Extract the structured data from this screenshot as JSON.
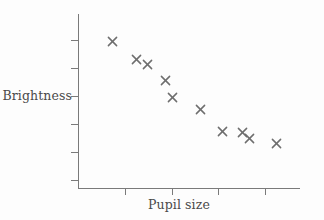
{
  "chart_data": {
    "type": "scatter",
    "title": "",
    "xlabel": "Pupil size",
    "ylabel": "Brightness",
    "grid": false,
    "legend": null,
    "axis_ticks_labeled": false,
    "marker": "x",
    "marker_color": "#6e6e6e",
    "axis_color": "#7a7a7a",
    "background_color": "#fdfdfd",
    "xlim": [
      0,
      10
    ],
    "ylim": [
      0,
      10
    ],
    "x_tick_values": [
      2,
      4,
      6,
      8
    ],
    "y_tick_values": [
      1.5,
      3.0,
      4.5,
      6.0,
      7.5,
      9.0
    ],
    "points": [
      {
        "x": 1.55,
        "y": 8.43
      },
      {
        "x": 2.62,
        "y": 7.4
      },
      {
        "x": 3.12,
        "y": 7.11
      },
      {
        "x": 3.95,
        "y": 6.2
      },
      {
        "x": 4.26,
        "y": 5.23
      },
      {
        "x": 5.52,
        "y": 4.51
      },
      {
        "x": 6.5,
        "y": 3.23
      },
      {
        "x": 7.4,
        "y": 3.17
      },
      {
        "x": 7.72,
        "y": 2.86
      },
      {
        "x": 8.96,
        "y": 2.54
      }
    ]
  },
  "labels": {
    "y_axis": "Brightness",
    "x_axis": "Pupil size"
  }
}
